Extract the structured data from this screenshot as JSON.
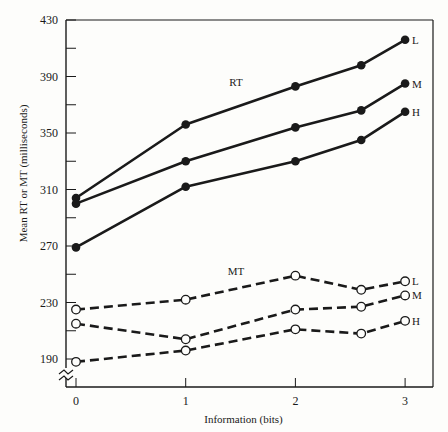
{
  "chart_data": {
    "type": "line",
    "title": "",
    "xlabel": "Information (bits)",
    "ylabel": "Mean RT or MT (milliseconds)",
    "x_ticks": [
      0,
      1,
      2,
      3
    ],
    "y_ticks": [
      190,
      230,
      270,
      310,
      350,
      390,
      430
    ],
    "ylim": [
      170,
      430
    ],
    "xlim": [
      -0.08,
      3.2
    ],
    "grid": false,
    "group_labels": {
      "rt": "RT",
      "mt": "MT"
    },
    "x": [
      0,
      1,
      2,
      2.6,
      3
    ],
    "series": [
      {
        "name": "RT L",
        "group": "RT",
        "label": "L",
        "style": "solid",
        "marker": "filled",
        "values": [
          304,
          356,
          383,
          398,
          416
        ]
      },
      {
        "name": "RT M",
        "group": "RT",
        "label": "M",
        "style": "solid",
        "marker": "filled",
        "values": [
          300,
          330,
          354,
          366,
          385
        ]
      },
      {
        "name": "RT H",
        "group": "RT",
        "label": "H",
        "style": "solid",
        "marker": "filled",
        "values": [
          269,
          312,
          330,
          345,
          365
        ]
      },
      {
        "name": "MT L",
        "group": "MT",
        "label": "L",
        "style": "dashed",
        "marker": "open",
        "values": [
          225,
          232,
          249,
          239,
          245
        ]
      },
      {
        "name": "MT M",
        "group": "MT",
        "label": "M",
        "style": "dashed",
        "marker": "open",
        "values": [
          215,
          204,
          225,
          227,
          235
        ]
      },
      {
        "name": "MT H",
        "group": "MT",
        "label": "H",
        "style": "dashed",
        "marker": "open",
        "values": [
          188,
          196,
          211,
          208,
          217
        ]
      }
    ]
  }
}
